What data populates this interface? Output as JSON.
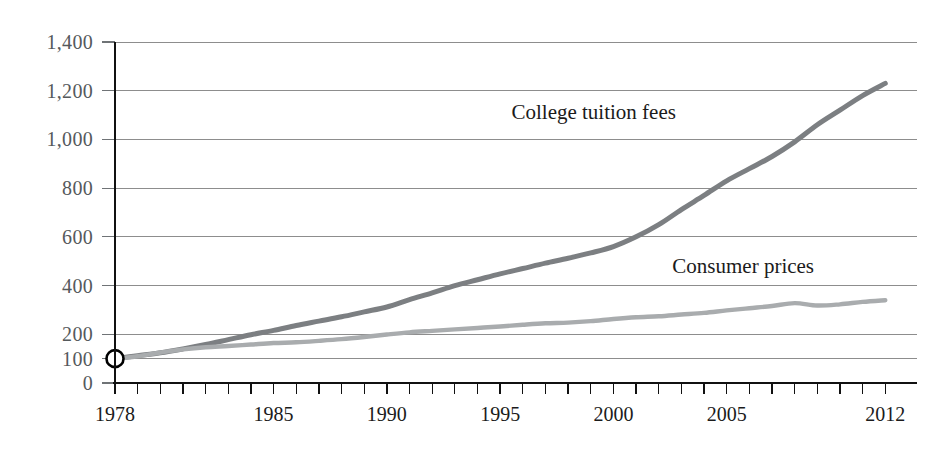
{
  "chart_data": {
    "type": "line",
    "title": "",
    "subtitle": "",
    "xlabel": "",
    "ylabel": "",
    "index_base": "1978 = 100",
    "xlim": [
      1978,
      2013.4
    ],
    "ylim": [
      0,
      1450
    ],
    "grid": "horizontal",
    "legend_position": "inline-annotations",
    "y_ticks": [
      0,
      100,
      200,
      400,
      600,
      800,
      1000,
      1200,
      1400
    ],
    "y_tick_labels": [
      "0",
      "100",
      "200",
      "400",
      "600",
      "800",
      "1,000",
      "1,200",
      "1,400"
    ],
    "x_ticks": [
      1978,
      1979,
      1980,
      1981,
      1982,
      1983,
      1984,
      1985,
      1986,
      1987,
      1988,
      1989,
      1990,
      1991,
      1992,
      1993,
      1994,
      1995,
      1996,
      1997,
      1998,
      1999,
      2000,
      2001,
      2002,
      2003,
      2004,
      2005,
      2006,
      2007,
      2008,
      2009,
      2010,
      2011,
      2012
    ],
    "x_tick_labels_shown": [
      "1978",
      "1985",
      "1990",
      "1995",
      "2000",
      "2005",
      "2012"
    ],
    "x_labeled_years": [
      1978,
      1985,
      1990,
      1995,
      2000,
      2005,
      2012
    ],
    "origin_marker": {
      "x": 1978,
      "y": 100,
      "shape": "open-circle"
    },
    "x": [
      1978,
      1979,
      1980,
      1981,
      1982,
      1983,
      1984,
      1985,
      1986,
      1987,
      1988,
      1989,
      1990,
      1991,
      1992,
      1993,
      1994,
      1995,
      1996,
      1997,
      1998,
      1999,
      2000,
      2001,
      2002,
      2003,
      2004,
      2005,
      2006,
      2007,
      2008,
      2009,
      2010,
      2011,
      2012
    ],
    "series": [
      {
        "name": "College tuition fees",
        "color": "#7c7f82",
        "label_x": 1995.5,
        "label_y": 1085,
        "values": [
          100,
          112,
          124,
          140,
          158,
          178,
          198,
          216,
          236,
          254,
          272,
          292,
          312,
          342,
          370,
          400,
          424,
          448,
          470,
          492,
          512,
          534,
          560,
          600,
          650,
          712,
          770,
          830,
          880,
          930,
          990,
          1060,
          1120,
          1180,
          1230
        ]
      },
      {
        "name": "Consumer prices",
        "color": "#a9acae",
        "label_x": 2002.6,
        "label_y": 452,
        "values": [
          100,
          110,
          125,
          138,
          147,
          152,
          158,
          164,
          167,
          173,
          180,
          189,
          199,
          208,
          214,
          220,
          226,
          232,
          239,
          245,
          248,
          254,
          263,
          270,
          274,
          281,
          288,
          298,
          307,
          316,
          328,
          318,
          323,
          333,
          340
        ]
      }
    ]
  },
  "axes": {
    "plot_left_px": 115,
    "plot_right_px": 917,
    "plot_top_px": 42,
    "plot_bottom_px": 383
  }
}
